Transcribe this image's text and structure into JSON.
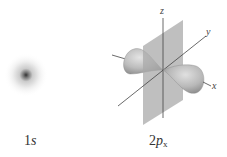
{
  "orbitals": [
    {
      "name": "1s",
      "label_num": "1",
      "label_letter": "s",
      "sub": ""
    },
    {
      "name": "2px",
      "label_num": "2",
      "label_letter": "p",
      "sub": "x"
    }
  ],
  "axes": {
    "x": "x",
    "y": "y",
    "z": "z"
  },
  "colors": {
    "plane": "#a9a9a9",
    "lobe": "#b8b8b8",
    "axis": "#444444"
  }
}
